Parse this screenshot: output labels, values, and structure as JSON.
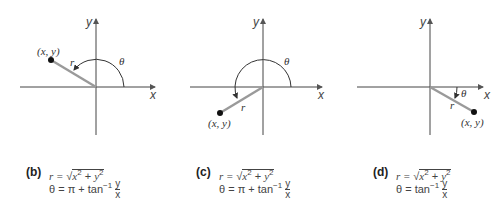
{
  "panels": [
    {
      "id": "b",
      "tag": "(b)",
      "point_label": "(x, y)",
      "r_label": "r",
      "theta_label": "θ",
      "x_axis_label": "x",
      "y_axis_label": "y",
      "formula_r_lhs": "r = ",
      "formula_r_rhs_a": "x",
      "formula_r_rhs_b": " + ",
      "formula_r_rhs_c": "y",
      "exp": "2",
      "formula_theta_lhs": "θ = ",
      "formula_theta_rhs": "π +  tan",
      "inv_exp": "−1",
      "frac_num": "y",
      "frac_den": "x",
      "quadrant": "II"
    },
    {
      "id": "c",
      "tag": "(c)",
      "point_label": "(x, y)",
      "r_label": "r",
      "theta_label": "θ",
      "x_axis_label": "x",
      "y_axis_label": "y",
      "formula_r_lhs": "r = ",
      "formula_r_rhs_a": "x",
      "formula_r_rhs_b": " + ",
      "formula_r_rhs_c": "y",
      "exp": "2",
      "formula_theta_lhs": "θ = ",
      "formula_theta_rhs": "π + tan",
      "inv_exp": "−1",
      "frac_num": "y",
      "frac_den": "x",
      "quadrant": "III"
    },
    {
      "id": "d",
      "tag": "(d)",
      "point_label": "(x, y)",
      "r_label": "r",
      "theta_label": "θ",
      "x_axis_label": "x",
      "y_axis_label": "y",
      "formula_r_lhs": "r = ",
      "formula_r_rhs_a": "x",
      "formula_r_rhs_b": " + ",
      "formula_r_rhs_c": "y",
      "exp": "2",
      "formula_theta_lhs": "θ = ",
      "formula_theta_rhs": "tan",
      "inv_exp": "−1",
      "frac_num": "y",
      "frac_den": "x",
      "quadrant": "IV"
    }
  ]
}
